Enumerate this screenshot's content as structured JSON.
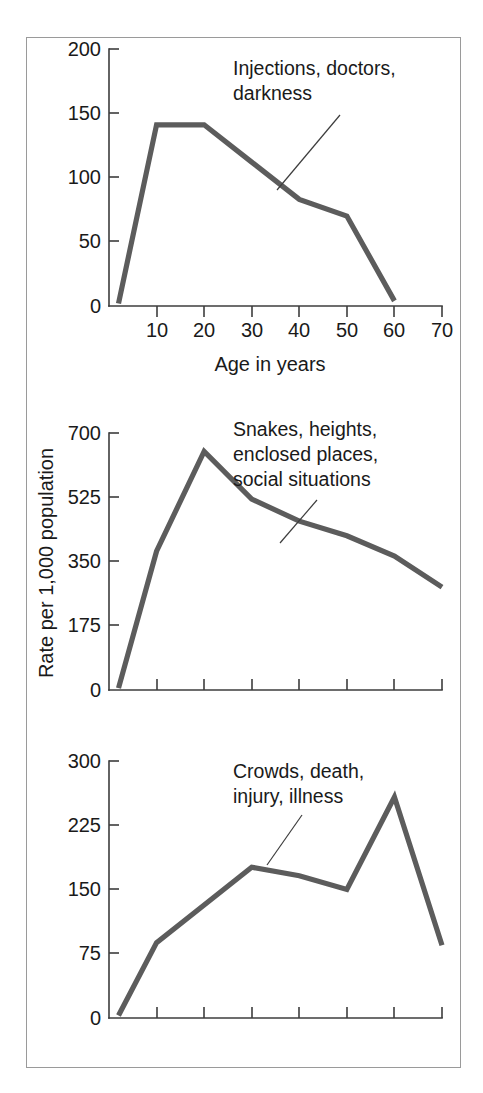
{
  "figure": {
    "background_color": "#ffffff",
    "frame_color": "#9a9a9a",
    "line_color": "#5c5c5c",
    "axis_color": "#3d3d3d",
    "text_color": "#1a1a1a",
    "shared_y_axis_title": "Rate per 1,000 population",
    "shared_x_axis_title": "Age in years"
  },
  "chart_data": [
    {
      "type": "line",
      "title": "",
      "annotation": "Injections, doctors, darkness",
      "annotation_lines": [
        "Injections, doctors,",
        "darkness"
      ],
      "xlabel": "Age in years",
      "ylabel": "",
      "xlim": [
        0,
        70
      ],
      "ylim": [
        0,
        200
      ],
      "xticks": [
        0,
        10,
        20,
        30,
        40,
        50,
        60,
        70
      ],
      "xticklabels": [
        "",
        "10",
        "20",
        "30",
        "40",
        "50",
        "60",
        "70"
      ],
      "yticks": [
        0,
        50,
        100,
        150,
        200
      ],
      "yticklabels": [
        "0",
        "50",
        "100",
        "150",
        "200"
      ],
      "grid": false,
      "legend": "none",
      "x": [
        2,
        10,
        20,
        30,
        40,
        50,
        60
      ],
      "values": [
        2,
        141,
        141,
        112,
        83,
        70,
        4
      ],
      "series": [
        {
          "name": "Injections, doctors, darkness",
          "x": [
            2,
            10,
            20,
            30,
            40,
            50,
            60
          ],
          "values": [
            2,
            141,
            141,
            112,
            83,
            70,
            4
          ]
        }
      ]
    },
    {
      "type": "line",
      "title": "",
      "annotation": "Snakes, heights, enclosed places, social situations",
      "annotation_lines": [
        "Snakes, heights,",
        "enclosed places,",
        "social situations"
      ],
      "xlabel": "",
      "ylabel": "Rate per 1,000 population",
      "xlim": [
        0,
        70
      ],
      "ylim": [
        0,
        700
      ],
      "xticks": [
        0,
        10,
        20,
        30,
        40,
        50,
        60,
        70
      ],
      "xticklabels": [
        "",
        "",
        "",
        "",
        "",
        "",
        "",
        ""
      ],
      "yticks": [
        0,
        175,
        350,
        525,
        700
      ],
      "yticklabels": [
        "0",
        "175",
        "350",
        "525",
        "700"
      ],
      "grid": false,
      "legend": "none",
      "x": [
        2,
        10,
        20,
        30,
        40,
        50,
        60,
        70
      ],
      "values": [
        5,
        378,
        650,
        520,
        460,
        420,
        365,
        280
      ],
      "series": [
        {
          "name": "Snakes, heights, enclosed places, social situations",
          "x": [
            2,
            10,
            20,
            30,
            40,
            50,
            60,
            70
          ],
          "values": [
            5,
            378,
            650,
            520,
            460,
            420,
            365,
            280
          ]
        }
      ]
    },
    {
      "type": "line",
      "title": "",
      "annotation": "Crowds, death, injury, illness",
      "annotation_lines": [
        "Crowds, death,",
        "injury, illness"
      ],
      "xlabel": "",
      "ylabel": "",
      "xlim": [
        0,
        70
      ],
      "ylim": [
        0,
        300
      ],
      "xticks": [
        0,
        10,
        20,
        30,
        40,
        50,
        60,
        70
      ],
      "xticklabels": [
        "",
        "",
        "",
        "",
        "",
        "",
        "",
        ""
      ],
      "yticks": [
        0,
        75,
        150,
        225,
        300
      ],
      "yticklabels": [
        "0",
        "75",
        "150",
        "225",
        "300"
      ],
      "grid": false,
      "legend": "none",
      "x": [
        2,
        10,
        20,
        30,
        40,
        50,
        60,
        70
      ],
      "values": [
        3,
        88,
        132,
        176,
        166,
        150,
        258,
        85
      ],
      "series": [
        {
          "name": "Crowds, death, injury, illness",
          "x": [
            2,
            10,
            20,
            30,
            40,
            50,
            60,
            70
          ],
          "values": [
            3,
            88,
            132,
            176,
            166,
            150,
            258,
            85
          ]
        }
      ]
    }
  ],
  "panel1": {
    "ytick0": "0",
    "ytick1": "50",
    "ytick2": "100",
    "ytick3": "150",
    "ytick4": "200",
    "xtick10": "10",
    "xtick20": "20",
    "xtick30": "30",
    "xtick40": "40",
    "xtick50": "50",
    "xtick60": "60",
    "xtick70": "70",
    "xaxis_title": "Age in years",
    "annot_line1": "Injections, doctors,",
    "annot_line2": "darkness"
  },
  "panel2": {
    "ytick0": "0",
    "ytick1": "175",
    "ytick2": "350",
    "ytick3": "525",
    "ytick4": "700",
    "yaxis_title": "Rate per 1,000 population",
    "annot_line1": "Snakes, heights,",
    "annot_line2": "enclosed places,",
    "annot_line3": "social situations"
  },
  "panel3": {
    "ytick0": "0",
    "ytick1": "75",
    "ytick2": "150",
    "ytick3": "225",
    "ytick4": "300",
    "annot_line1": "Crowds, death,",
    "annot_line2": "injury, illness"
  }
}
